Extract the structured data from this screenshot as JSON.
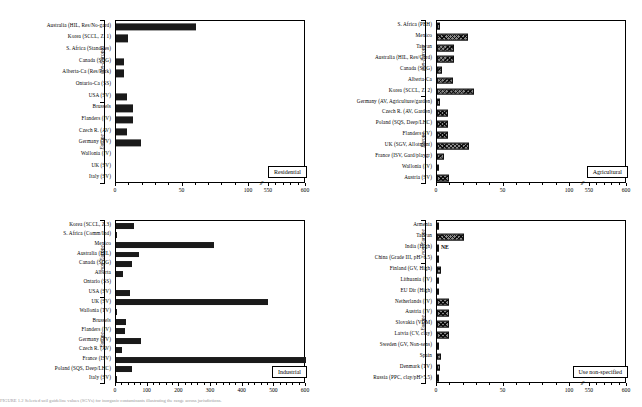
{
  "figure": {
    "caption": "FIGURE 1.2  Selected soil guideline values (SGVs) for inorganic contaminants illustrating the range across jurisdictions."
  },
  "axis_groups": {
    "non_europe": "non-Europe",
    "europe": "Europe"
  },
  "chart_data": [
    {
      "type": "bar",
      "title": "Residential",
      "panel": "top-left",
      "orientation": "horizontal",
      "xlabel": "",
      "ylabel": "",
      "xlim": [
        0,
        600
      ],
      "xticks": [
        0,
        50,
        100,
        550,
        600
      ],
      "axis_break": true,
      "axis_break_after": 100,
      "grid": false,
      "bar_style": "solid-black",
      "groups": [
        {
          "name": "non-Europe",
          "categories": [
            "Australia (HIL, Res/No-gard)",
            "Korea (SCCL, Z. 1)",
            "S. Africa (StandRes)",
            "Canada (SQG)",
            "Alberta-Ca (Res/Park)",
            "Ontario-Ca (SS)",
            "USA (SV)"
          ],
          "values": [
            60,
            9,
            0,
            6,
            6,
            0,
            8
          ]
        },
        {
          "name": "Europe",
          "categories": [
            "Brussels",
            "Flanders (IV)",
            "Czech R. (AV)",
            "Germany (TV)",
            "Wallonia (IV)",
            "UK (SV)",
            "Italy (SV)"
          ],
          "values": [
            13,
            13,
            8,
            19,
            0,
            0,
            0
          ]
        }
      ]
    },
    {
      "type": "bar",
      "title": "Agricultural",
      "panel": "top-right",
      "orientation": "horizontal",
      "xlabel": "",
      "ylabel": "",
      "xlim": [
        0,
        600
      ],
      "xticks": [
        0,
        50,
        100,
        550,
        600
      ],
      "axis_break": true,
      "axis_break_after": 100,
      "grid": false,
      "bar_style": "hatched",
      "groups": [
        {
          "name": "non-Europe",
          "categories": [
            "S. Africa (PEH)",
            "Mexico",
            "Taiwan",
            "Australia (HIL, Res/Gard)",
            "Canada (SQG)",
            "Alberta-Ca",
            "Korea (SCCL, Z. 2)"
          ],
          "values": [
            2,
            23,
            13,
            13,
            4,
            12,
            28
          ]
        },
        {
          "name": "Europe",
          "categories": [
            "Germany (AV, Agriculture/garden)",
            "Czech R. (AV, Garden)",
            "Poland (SQS, Deep/LHC)",
            "Flanders (IV)",
            "UK (SGV, Allotment)",
            "France (ISV, Gard/playgr)",
            "Wallonia (IV)",
            "Austria (SV)"
          ],
          "values": [
            2,
            8,
            8,
            8,
            24,
            5,
            1,
            9
          ]
        }
      ]
    },
    {
      "type": "bar",
      "title": "Industrial",
      "panel": "bottom-left",
      "orientation": "horizontal",
      "xlabel": "",
      "ylabel": "",
      "xlim": [
        0,
        600
      ],
      "xticks": [
        0,
        100,
        200,
        300,
        400,
        500,
        600
      ],
      "axis_break": false,
      "grid": false,
      "bar_style": "solid-black",
      "groups": [
        {
          "name": "non-Europe",
          "categories": [
            "Korea (SCCL, Z.3)",
            "S. Africa (Comm/Ind)",
            "Mexico",
            "Australia (HIL)",
            "Canada (SQG)",
            "Alberta",
            "Ontario (SS)",
            "USA (SV)"
          ],
          "values": [
            57,
            3,
            310,
            73,
            50,
            22,
            0,
            45
          ]
        },
        {
          "name": "Europe",
          "categories": [
            "UK (SV)",
            "Wallonia (TV)",
            "Brussels",
            "Flanders (IV)",
            "Germany (TV)",
            "Czech R. (AV)",
            "France (ISV)",
            "Poland (SQS, Deep/LHC)",
            "Italy (SV)"
          ],
          "values": [
            480,
            2,
            30,
            29,
            80,
            20,
            600,
            50,
            3
          ]
        }
      ]
    },
    {
      "type": "bar",
      "title": "Use non-specified",
      "panel": "bottom-right",
      "orientation": "horizontal",
      "xlabel": "",
      "ylabel": "",
      "xlim": [
        0,
        600
      ],
      "xticks": [
        0,
        50,
        100,
        550,
        600
      ],
      "axis_break": true,
      "axis_break_after": 100,
      "grid": false,
      "bar_style": "hatched",
      "annotations": [
        {
          "category": "India (High)",
          "text": "NE"
        }
      ],
      "groups": [
        {
          "name": "non-Europe",
          "categories": [
            "Armenia",
            "Taiwan",
            "India (High)",
            "China (Grade III, pH>6.5)"
          ],
          "values": [
            1,
            20,
            0,
            0
          ]
        },
        {
          "name": "Europe",
          "categories": [
            "Finland (GV, High)",
            "Lithuania (IV)",
            "EU Dir (High)",
            "Netherlands (IV)",
            "Austria (IV)",
            "Slovakia (VDM)",
            "Latvia (CV, clay)",
            "Sweden (GV, Non-sens)",
            "Spain",
            "Denmark (TV)",
            "Russia (PPC, clay/pH>5.5)"
          ],
          "values": [
            3,
            0,
            0,
            9,
            9,
            9,
            9,
            1,
            3,
            2,
            130
          ]
        }
      ]
    }
  ]
}
